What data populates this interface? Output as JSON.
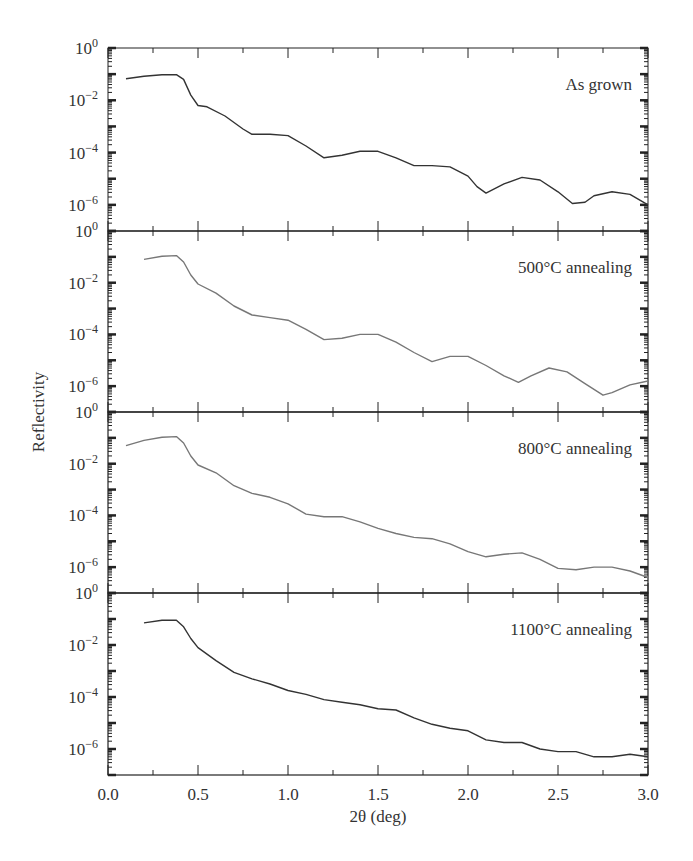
{
  "chart_data": {
    "type": "line",
    "layout": "4 vertically stacked panels sharing x-axis",
    "xlabel": "2θ (deg)",
    "ylabel": "Reflectivity",
    "xlim": [
      0.0,
      3.0
    ],
    "x_ticks": [
      "0.0",
      "0.5",
      "1.0",
      "1.5",
      "2.0",
      "2.5",
      "3.0"
    ],
    "y_scale": "log",
    "ylim": [
      1e-07,
      1
    ],
    "y_ticks": [
      {
        "exp": "0",
        "value": 1
      },
      {
        "exp": "−2",
        "value": 0.01
      },
      {
        "exp": "−4",
        "value": 0.0001
      },
      {
        "exp": "−6",
        "value": 1e-06
      }
    ],
    "grid": false,
    "panels": [
      {
        "label": "As grown",
        "color": "#333333",
        "x": [
          0.1,
          0.2,
          0.3,
          0.38,
          0.42,
          0.46,
          0.5,
          0.55,
          0.65,
          0.75,
          0.8,
          0.9,
          1.0,
          1.1,
          1.2,
          1.3,
          1.4,
          1.5,
          1.6,
          1.7,
          1.8,
          1.9,
          2.0,
          2.05,
          2.1,
          2.2,
          2.3,
          2.4,
          2.5,
          2.58,
          2.65,
          2.7,
          2.8,
          2.9,
          3.0
        ],
        "log10y": [
          -1.18,
          -1.08,
          -1.02,
          -1.02,
          -1.2,
          -1.8,
          -2.2,
          -2.25,
          -2.6,
          -3.1,
          -3.3,
          -3.3,
          -3.35,
          -3.75,
          -4.2,
          -4.1,
          -3.95,
          -3.95,
          -4.2,
          -4.5,
          -4.5,
          -4.55,
          -4.9,
          -5.3,
          -5.55,
          -5.2,
          -4.95,
          -5.05,
          -5.5,
          -5.95,
          -5.9,
          -5.65,
          -5.5,
          -5.6,
          -6.0
        ]
      },
      {
        "label": "500°C annealing",
        "color": "#777777",
        "x": [
          0.2,
          0.3,
          0.38,
          0.42,
          0.46,
          0.5,
          0.6,
          0.7,
          0.8,
          0.9,
          1.0,
          1.1,
          1.2,
          1.3,
          1.4,
          1.5,
          1.6,
          1.7,
          1.8,
          1.9,
          2.0,
          2.1,
          2.2,
          2.28,
          2.35,
          2.45,
          2.55,
          2.65,
          2.75,
          2.8,
          2.9,
          3.0
        ],
        "log10y": [
          -1.1,
          -0.98,
          -0.95,
          -1.2,
          -1.7,
          -2.05,
          -2.4,
          -2.9,
          -3.25,
          -3.35,
          -3.45,
          -3.8,
          -4.2,
          -4.15,
          -4.0,
          -4.0,
          -4.3,
          -4.7,
          -5.05,
          -4.85,
          -4.85,
          -5.2,
          -5.6,
          -5.85,
          -5.6,
          -5.3,
          -5.45,
          -5.9,
          -6.35,
          -6.25,
          -5.95,
          -5.8
        ]
      },
      {
        "label": "800°C annealing",
        "color": "#777777",
        "x": [
          0.1,
          0.2,
          0.3,
          0.38,
          0.42,
          0.46,
          0.5,
          0.6,
          0.7,
          0.8,
          0.9,
          1.0,
          1.1,
          1.2,
          1.3,
          1.4,
          1.5,
          1.6,
          1.7,
          1.8,
          1.9,
          2.0,
          2.1,
          2.2,
          2.3,
          2.4,
          2.5,
          2.6,
          2.7,
          2.8,
          2.9,
          3.0
        ],
        "log10y": [
          -1.3,
          -1.1,
          -0.98,
          -0.95,
          -1.2,
          -1.7,
          -2.05,
          -2.35,
          -2.85,
          -3.15,
          -3.3,
          -3.55,
          -3.95,
          -4.05,
          -4.05,
          -4.25,
          -4.5,
          -4.7,
          -4.85,
          -4.9,
          -5.1,
          -5.4,
          -5.6,
          -5.5,
          -5.45,
          -5.7,
          -6.05,
          -6.1,
          -6.0,
          -6.0,
          -6.15,
          -6.4
        ]
      },
      {
        "label": "1100°C annealing",
        "color": "#333333",
        "x": [
          0.2,
          0.3,
          0.38,
          0.42,
          0.46,
          0.5,
          0.6,
          0.7,
          0.8,
          0.9,
          1.0,
          1.1,
          1.2,
          1.3,
          1.4,
          1.5,
          1.6,
          1.7,
          1.8,
          1.9,
          2.0,
          2.1,
          2.2,
          2.3,
          2.4,
          2.5,
          2.6,
          2.7,
          2.8,
          2.9,
          3.0
        ],
        "log10y": [
          -1.15,
          -1.05,
          -1.05,
          -1.3,
          -1.75,
          -2.1,
          -2.6,
          -3.05,
          -3.3,
          -3.5,
          -3.75,
          -3.9,
          -4.1,
          -4.2,
          -4.3,
          -4.45,
          -4.5,
          -4.8,
          -5.05,
          -5.2,
          -5.3,
          -5.65,
          -5.75,
          -5.75,
          -6.0,
          -6.1,
          -6.1,
          -6.3,
          -6.3,
          -6.2,
          -6.3
        ]
      }
    ]
  }
}
